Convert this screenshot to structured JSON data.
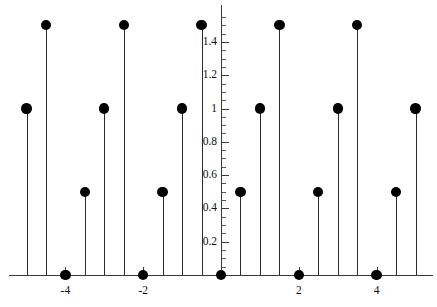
{
  "chart_data": {
    "type": "scatter",
    "subtype": "stem",
    "title": "",
    "xlabel": "",
    "ylabel": "",
    "xlim": [
      -5.45,
      5.45
    ],
    "ylim": [
      0,
      1.62
    ],
    "grid": false,
    "legend": null,
    "x_ticks_major": [
      -4,
      -2,
      2,
      4
    ],
    "x_tick_labels": [
      "-4",
      "-2",
      "2",
      "4"
    ],
    "x_ticks_minor": [
      -5,
      -4.5,
      -3.5,
      -3,
      -2.5,
      -1.5,
      -1,
      -0.5,
      0,
      0.5,
      1,
      1.5,
      2.5,
      3,
      3.5,
      4.5,
      5
    ],
    "y_ticks_major": [
      0.2,
      0.4,
      0.6,
      0.8,
      1,
      1.2,
      1.4
    ],
    "y_tick_labels": [
      "0.2",
      "0.4",
      "0.6",
      "0.8",
      "1",
      "1.2",
      "1.4"
    ],
    "y_ticks_minor": [
      0.05,
      0.1,
      0.15,
      0.25,
      0.3,
      0.35,
      0.45,
      0.5,
      0.55,
      0.65,
      0.7,
      0.75,
      0.85,
      0.9,
      0.95,
      1.05,
      1.1,
      1.15,
      1.25,
      1.3,
      1.35,
      1.45,
      1.5,
      1.55
    ],
    "marker": "filled-circle",
    "marker_color": "#000000",
    "stem_color": "#2a2a2a",
    "axis_color": "#3a3a3a",
    "x": [
      -5,
      -4.5,
      -4,
      -3.5,
      -3,
      -2.5,
      -2,
      -1.5,
      -1,
      -0.5,
      0,
      0.5,
      1,
      1.5,
      2,
      2.5,
      3,
      3.5,
      4,
      4.5,
      5
    ],
    "values": [
      1,
      1.5,
      0,
      0.5,
      1,
      1.5,
      0,
      0.5,
      1,
      1.5,
      0,
      0.5,
      1,
      1.5,
      0,
      0.5,
      1,
      1.5,
      0,
      0.5,
      1
    ]
  }
}
